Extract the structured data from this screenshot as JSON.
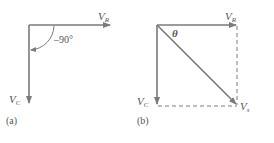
{
  "figure_a": {
    "caption": "(a)",
    "vector_horizontal": {
      "label": "V",
      "subscript": "R"
    },
    "vector_vertical": {
      "label": "V",
      "subscript": "C"
    },
    "angle_label": "–90°"
  },
  "figure_b": {
    "caption": "(b)",
    "vector_horizontal": {
      "label": "V",
      "subscript": "R"
    },
    "vector_vertical": {
      "label": "V",
      "subscript": "C"
    },
    "vector_resultant": {
      "label": "V",
      "subscript": "s"
    },
    "angle_label": "θ"
  },
  "colors": {
    "line": "#7a7a7a",
    "text": "#555555"
  }
}
